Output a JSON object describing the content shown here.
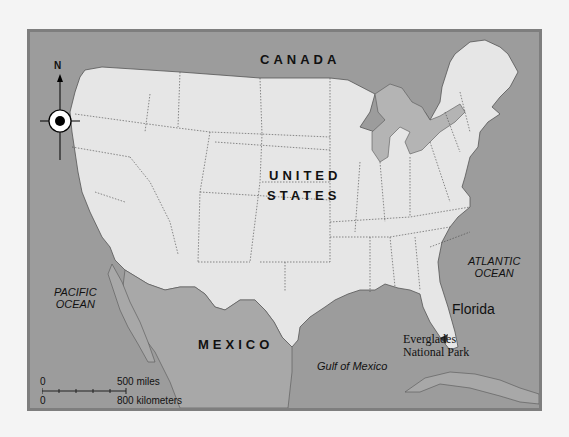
{
  "map": {
    "countries": {
      "canada": "CANADA",
      "us_line1": "UNITED",
      "us_line2": "STATES",
      "mexico": "MEXICO"
    },
    "water": {
      "pacific_line1": "PACIFIC",
      "pacific_line2": "OCEAN",
      "atlantic_line1": "ATLANTIC",
      "atlantic_line2": "OCEAN",
      "gulf": "Gulf of Mexico"
    },
    "places": {
      "florida": "Florida",
      "everglades_line1": "Everglades",
      "everglades_line2": "National Park"
    },
    "compass": {
      "north_label": "N",
      "icon": "compass-rose-icon"
    },
    "scale": {
      "miles_zero": "0",
      "miles_label": "500 miles",
      "km_zero": "0",
      "km_label": "800 kilometers"
    },
    "colors": {
      "water": "#9c9c9c",
      "land_us": "#e6e6e6",
      "land_foreign": "#a8a8a8",
      "frame": "#7e7e7e",
      "background": "#f4f4f4"
    }
  }
}
